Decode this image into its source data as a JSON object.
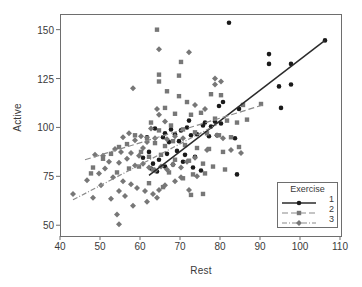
{
  "chart_data": {
    "type": "scatter",
    "title": "",
    "xlabel": "Rest",
    "ylabel": "Active",
    "xlim": [
      40,
      110
    ],
    "ylim": [
      45,
      158
    ],
    "xticks": [
      40,
      50,
      60,
      70,
      80,
      90,
      100,
      110
    ],
    "yticks": [
      50,
      75,
      100,
      125,
      150
    ],
    "grid": false,
    "legend": {
      "title": "Exercise",
      "position": "lower-right",
      "entries": [
        {
          "label": "1",
          "marker": "circle",
          "linestyle": "solid",
          "color": "#1a1a1a"
        },
        {
          "label": "2",
          "marker": "square",
          "linestyle": "dashed",
          "color": "#777777"
        },
        {
          "label": "3",
          "marker": "diamond",
          "linestyle": "dashdot",
          "color": "#777777"
        }
      ]
    },
    "series": [
      {
        "name": "1",
        "marker": "circle",
        "color": "#1a1a1a",
        "linestyle": "solid",
        "fit_line": {
          "x": [
            62.0,
            106.0
          ],
          "y": [
            76.0,
            145.0
          ]
        },
        "points": [
          [
            82.0,
            154.0
          ],
          [
            92.0,
            138.0
          ],
          [
            92.0,
            133.0
          ],
          [
            97.5,
            133.0
          ],
          [
            106.0,
            145.0
          ],
          [
            94.5,
            121.5
          ],
          [
            97.5,
            122.5
          ],
          [
            95.0,
            110.5
          ],
          [
            84.5,
            110.0
          ],
          [
            80.5,
            113.5
          ],
          [
            79.5,
            111.5
          ],
          [
            76.0,
            103.0
          ],
          [
            75.5,
            101.5
          ],
          [
            72.0,
            104.0
          ],
          [
            71.5,
            100.5
          ],
          [
            70.0,
            99.0
          ],
          [
            68.5,
            97.0
          ],
          [
            67.5,
            99.5
          ],
          [
            66.0,
            97.5
          ],
          [
            65.5,
            95.5
          ],
          [
            67.0,
            93.0
          ],
          [
            69.5,
            93.5
          ],
          [
            72.5,
            96.5
          ],
          [
            74.0,
            97.0
          ],
          [
            77.5,
            101.0
          ],
          [
            78.5,
            103.5
          ],
          [
            83.5,
            95.0
          ],
          [
            84.0,
            76.5
          ],
          [
            73.5,
            85.5
          ],
          [
            71.0,
            86.5
          ],
          [
            69.0,
            88.5
          ],
          [
            66.5,
            87.0
          ],
          [
            64.5,
            84.0
          ],
          [
            63.0,
            82.0
          ],
          [
            62.5,
            79.5
          ],
          [
            64.0,
            78.0
          ],
          [
            66.0,
            80.5
          ],
          [
            68.0,
            81.5
          ],
          [
            70.5,
            83.0
          ],
          [
            73.0,
            80.0
          ],
          [
            75.0,
            78.5
          ],
          [
            77.0,
            96.0
          ],
          [
            79.0,
            96.5
          ],
          [
            80.0,
            102.5
          ],
          [
            61.5,
            95.5
          ],
          [
            63.5,
            100.0
          ],
          [
            60.5,
            85.0
          ],
          [
            62.0,
            88.0
          ]
        ]
      },
      {
        "name": "2",
        "marker": "square",
        "color": "#777777",
        "linestyle": "dashed",
        "fit_line": {
          "x": [
            46.0,
            90.5
          ],
          "y": [
            84.0,
            112.0
          ]
        },
        "points": [
          [
            64.0,
            150.5
          ],
          [
            70.0,
            134.0
          ],
          [
            64.5,
            127.5
          ],
          [
            69.5,
            127.0
          ],
          [
            64.5,
            124.0
          ],
          [
            66.5,
            119.0
          ],
          [
            69.5,
            116.5
          ],
          [
            71.5,
            113.5
          ],
          [
            77.5,
            117.5
          ],
          [
            80.0,
            117.0
          ],
          [
            85.5,
            112.0
          ],
          [
            90.0,
            112.5
          ],
          [
            66.0,
            110.5
          ],
          [
            68.5,
            107.5
          ],
          [
            72.5,
            107.0
          ],
          [
            75.0,
            108.0
          ],
          [
            78.5,
            105.0
          ],
          [
            81.5,
            104.0
          ],
          [
            84.0,
            103.0
          ],
          [
            86.5,
            104.5
          ],
          [
            62.5,
            103.0
          ],
          [
            64.5,
            99.0
          ],
          [
            67.5,
            101.5
          ],
          [
            70.5,
            99.5
          ],
          [
            73.5,
            98.0
          ],
          [
            76.5,
            97.5
          ],
          [
            79.5,
            96.5
          ],
          [
            82.5,
            95.5
          ],
          [
            61.5,
            95.0
          ],
          [
            63.5,
            92.5
          ],
          [
            66.0,
            91.0
          ],
          [
            68.0,
            93.5
          ],
          [
            71.0,
            91.5
          ],
          [
            74.0,
            90.0
          ],
          [
            77.0,
            89.5
          ],
          [
            80.5,
            88.0
          ],
          [
            84.5,
            90.5
          ],
          [
            58.5,
            96.5
          ],
          [
            56.5,
            92.0
          ],
          [
            54.5,
            90.5
          ],
          [
            52.5,
            87.0
          ],
          [
            50.5,
            84.5
          ],
          [
            48.0,
            80.0
          ],
          [
            47.5,
            77.0
          ],
          [
            60.0,
            88.0
          ],
          [
            62.0,
            85.5
          ],
          [
            65.0,
            86.5
          ],
          [
            68.5,
            84.0
          ],
          [
            72.0,
            83.5
          ],
          [
            75.5,
            82.0
          ],
          [
            78.0,
            80.5
          ],
          [
            81.0,
            79.0
          ],
          [
            73.0,
            76.5
          ],
          [
            76.0,
            77.0
          ],
          [
            70.5,
            74.5
          ],
          [
            67.0,
            77.5
          ],
          [
            63.0,
            79.0
          ],
          [
            59.5,
            80.5
          ],
          [
            57.0,
            79.5
          ],
          [
            54.0,
            77.5
          ],
          [
            72.5,
            66.0
          ],
          [
            75.5,
            66.5
          ],
          [
            65.5,
            70.0
          ],
          [
            62.0,
            72.0
          ]
        ]
      },
      {
        "name": "3",
        "marker": "diamond",
        "color": "#777777",
        "linestyle": "dashdot",
        "fit_line": {
          "x": [
            43.0,
            79.0
          ],
          "y": [
            63.5,
            102.0
          ]
        },
        "points": [
          [
            64.5,
            140.5
          ],
          [
            58.0,
            120.5
          ],
          [
            64.0,
            110.0
          ],
          [
            64.5,
            107.0
          ],
          [
            66.0,
            103.5
          ],
          [
            72.0,
            139.0
          ],
          [
            78.5,
            125.5
          ],
          [
            78.5,
            122.5
          ],
          [
            80.0,
            124.0
          ],
          [
            73.5,
            112.0
          ],
          [
            76.0,
            110.0
          ],
          [
            62.5,
            100.0
          ],
          [
            57.0,
            97.5
          ],
          [
            55.5,
            95.5
          ],
          [
            58.5,
            94.0
          ],
          [
            60.0,
            96.0
          ],
          [
            61.5,
            93.0
          ],
          [
            63.5,
            95.0
          ],
          [
            66.5,
            94.5
          ],
          [
            68.5,
            96.0
          ],
          [
            70.5,
            95.0
          ],
          [
            53.5,
            89.5
          ],
          [
            55.0,
            88.0
          ],
          [
            57.5,
            87.5
          ],
          [
            50.5,
            86.0
          ],
          [
            48.5,
            86.5
          ],
          [
            52.0,
            83.0
          ],
          [
            54.5,
            82.5
          ],
          [
            56.5,
            84.5
          ],
          [
            58.5,
            81.0
          ],
          [
            60.5,
            82.0
          ],
          [
            62.0,
            80.0
          ],
          [
            63.5,
            78.5
          ],
          [
            65.0,
            80.5
          ],
          [
            66.5,
            79.0
          ],
          [
            68.0,
            81.5
          ],
          [
            70.0,
            80.0
          ],
          [
            71.5,
            83.0
          ],
          [
            73.5,
            85.0
          ],
          [
            76.5,
            89.0
          ],
          [
            79.0,
            96.5
          ],
          [
            80.5,
            95.0
          ],
          [
            46.5,
            73.5
          ],
          [
            43.0,
            66.5
          ],
          [
            49.5,
            77.0
          ],
          [
            51.0,
            79.5
          ],
          [
            53.0,
            75.0
          ],
          [
            55.5,
            73.0
          ],
          [
            57.5,
            71.5
          ],
          [
            59.0,
            69.5
          ],
          [
            61.0,
            68.0
          ],
          [
            63.0,
            66.5
          ],
          [
            64.5,
            68.5
          ],
          [
            66.0,
            71.0
          ],
          [
            68.5,
            73.0
          ],
          [
            70.0,
            75.0
          ],
          [
            54.5,
            68.0
          ],
          [
            56.0,
            65.5
          ],
          [
            52.5,
            64.0
          ],
          [
            58.0,
            60.5
          ],
          [
            54.0,
            56.0
          ],
          [
            54.5,
            51.0
          ],
          [
            64.0,
            64.5
          ],
          [
            61.5,
            62.5
          ],
          [
            72.0,
            68.5
          ],
          [
            74.0,
            75.5
          ],
          [
            82.5,
            89.0
          ],
          [
            85.0,
            87.5
          ],
          [
            48.0,
            64.5
          ],
          [
            50.0,
            71.0
          ],
          [
            59.5,
            86.0
          ],
          [
            60.5,
            90.0
          ]
        ]
      }
    ]
  }
}
